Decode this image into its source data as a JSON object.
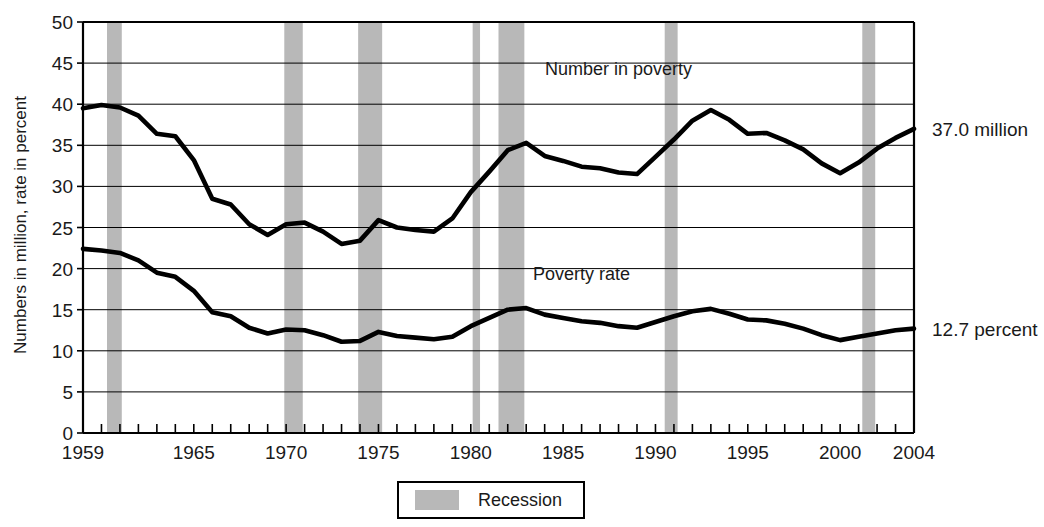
{
  "chart_data": {
    "type": "line",
    "title": "",
    "xlabel": "",
    "ylabel": "Numbers in million, rate in percent",
    "xlim": [
      1959,
      2004
    ],
    "ylim": [
      0,
      50
    ],
    "ytick_step": 5,
    "grid": true,
    "legend_position": "bottom-center",
    "yticks": [
      "50",
      "45",
      "40",
      "35",
      "30",
      "25",
      "20",
      "15",
      "10",
      "5",
      "0"
    ],
    "xticks": [
      "1959",
      "1965",
      "1970",
      "1975",
      "1980",
      "1985",
      "1990",
      "1995",
      "2000",
      "2004"
    ],
    "xtick_years": [
      1959,
      1965,
      1970,
      1975,
      1980,
      1985,
      1990,
      1995,
      2000,
      2004
    ],
    "years": [
      1959,
      1960,
      1961,
      1962,
      1963,
      1964,
      1965,
      1966,
      1967,
      1968,
      1969,
      1970,
      1971,
      1972,
      1973,
      1974,
      1975,
      1976,
      1977,
      1978,
      1979,
      1980,
      1981,
      1982,
      1983,
      1984,
      1985,
      1986,
      1987,
      1988,
      1989,
      1990,
      1991,
      1992,
      1993,
      1994,
      1995,
      1996,
      1997,
      1998,
      1999,
      2000,
      2001,
      2002,
      2003,
      2004
    ],
    "series": [
      {
        "name": "Number in poverty",
        "units": "million",
        "label_x_year": 1988,
        "label_y_value": 43.5,
        "endpoint_label": "37.0 million",
        "values": [
          39.5,
          39.9,
          39.6,
          38.6,
          36.4,
          36.1,
          33.2,
          28.5,
          27.8,
          25.4,
          24.1,
          25.4,
          25.6,
          24.5,
          23.0,
          23.4,
          25.9,
          25.0,
          24.7,
          24.5,
          26.1,
          29.3,
          31.8,
          34.4,
          35.3,
          33.7,
          33.1,
          32.4,
          32.2,
          31.7,
          31.5,
          33.6,
          35.7,
          38.0,
          39.3,
          38.1,
          36.4,
          36.5,
          35.6,
          34.5,
          32.8,
          31.6,
          32.9,
          34.6,
          35.9,
          37.0
        ]
      },
      {
        "name": "Poverty rate",
        "units": "percent",
        "label_x_year": 1986,
        "label_y_value": 18.6,
        "endpoint_label": "12.7 percent",
        "values": [
          22.4,
          22.2,
          21.9,
          21.0,
          19.5,
          19.0,
          17.3,
          14.7,
          14.2,
          12.8,
          12.1,
          12.6,
          12.5,
          11.9,
          11.1,
          11.2,
          12.3,
          11.8,
          11.6,
          11.4,
          11.7,
          13.0,
          14.0,
          15.0,
          15.2,
          14.4,
          14.0,
          13.6,
          13.4,
          13.0,
          12.8,
          13.5,
          14.2,
          14.8,
          15.1,
          14.5,
          13.8,
          13.7,
          13.3,
          12.7,
          11.9,
          11.3,
          11.7,
          12.1,
          12.5,
          12.7
        ]
      }
    ],
    "recessions": [
      {
        "start": 1960.3,
        "end": 1961.1
      },
      {
        "start": 1969.9,
        "end": 1970.9
      },
      {
        "start": 1973.9,
        "end": 1975.2
      },
      {
        "start": 1980.1,
        "end": 1980.5
      },
      {
        "start": 1981.5,
        "end": 1982.9
      },
      {
        "start": 1990.5,
        "end": 1991.2
      },
      {
        "start": 2001.2,
        "end": 2001.9
      }
    ],
    "legend": [
      {
        "label": "Recession",
        "swatch_color": "#b8b8b8"
      }
    ],
    "colors": {
      "line": "#000000",
      "recession": "#b8b8b8",
      "grid": "#000000",
      "background": "#ffffff"
    }
  }
}
